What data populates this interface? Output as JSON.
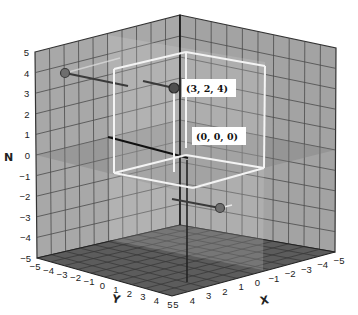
{
  "chart_data": {
    "type": "scatter3d",
    "title": "",
    "axes": {
      "x": {
        "label": "X",
        "range": [
          -5,
          5
        ],
        "ticks": [
          "5",
          "4",
          "3",
          "2",
          "1",
          "0",
          "-1",
          "-2",
          "-3",
          "-4",
          "-5"
        ]
      },
      "y": {
        "label": "Y",
        "range": [
          -5,
          5
        ],
        "ticks": [
          "-5",
          "-4",
          "-3",
          "-2",
          "-1",
          "0",
          "1",
          "2",
          "3",
          "4",
          "5"
        ]
      },
      "z": {
        "label": "N",
        "range": [
          -5,
          5
        ],
        "ticks": [
          "5",
          "4",
          "3",
          "2",
          "1",
          "0",
          "-1",
          "-2",
          "-3",
          "-4",
          "-5"
        ]
      }
    },
    "grid": true,
    "points": [
      {
        "label": "(3, 2, 4)",
        "x": 3,
        "y": 2,
        "z": 4
      },
      {
        "label": "(0, 0, 0)",
        "x": 0,
        "y": 0,
        "z": 0
      }
    ],
    "projections": [
      {
        "name": "projection-on-yz-wall",
        "description": "point (3,2,4) projected onto left wall"
      },
      {
        "name": "projection-on-xy-floor-side",
        "description": "point (3,2,4) projected toward lower right wall"
      }
    ],
    "box": {
      "from": [
        0,
        0,
        0
      ],
      "to": [
        3,
        2,
        4
      ],
      "edge_color": "#f2f2f2"
    },
    "colors": {
      "wall": "#a6a6a6",
      "floor": "#5a5a5a",
      "gridline": "#3a3a3a",
      "plane_z0": "#8c8c8c",
      "point": "#5e5e5e",
      "label_bg": "#ffffff"
    }
  },
  "labels": {
    "point_main": "(3, 2, 4)",
    "point_origin": "(0, 0, 0)",
    "z_axis": "N",
    "y_axis": "Y",
    "x_axis": "X"
  }
}
